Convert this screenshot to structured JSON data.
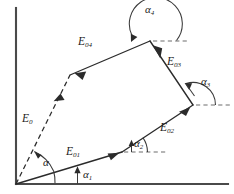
{
  "figure": {
    "background_color": "#ffffff",
    "line_color": "#2b2b2b",
    "axis_color": "#4a4a4a",
    "reference_line_color": "#6d6d6d"
  },
  "axes": {
    "origin": {
      "x": 16,
      "y": 184
    },
    "vertical_axis": {
      "x": 16,
      "y_top": 8,
      "y_bottom": 184
    },
    "horizontal_axis": {
      "y": 184,
      "x_left": 16,
      "x_right": 228
    }
  },
  "vectors": [
    {
      "id": "E01",
      "symbol": "E",
      "subscript": "01",
      "label": "E01",
      "from": {
        "x": 16,
        "y": 184
      },
      "to": {
        "x": 122,
        "y": 152
      },
      "style": "solid",
      "label_pos": {
        "x": 66,
        "y": 147
      }
    },
    {
      "id": "E02",
      "symbol": "E",
      "subscript": "02",
      "label": "E02",
      "from": {
        "x": 122,
        "y": 152
      },
      "to": {
        "x": 193,
        "y": 105
      },
      "style": "solid",
      "label_pos": {
        "x": 160,
        "y": 123
      }
    },
    {
      "id": "E03",
      "symbol": "E",
      "subscript": "03",
      "label": "E03",
      "from": {
        "x": 193,
        "y": 105
      },
      "to": {
        "x": 150,
        "y": 41
      },
      "style": "solid",
      "label_pos": {
        "x": 168,
        "y": 58
      }
    },
    {
      "id": "E04",
      "symbol": "E",
      "subscript": "04",
      "label": "E04",
      "from": {
        "x": 150,
        "y": 41
      },
      "to": {
        "x": 70,
        "y": 75
      },
      "style": "solid",
      "label_pos": {
        "x": 78,
        "y": 42
      }
    },
    {
      "id": "E0",
      "symbol": "E",
      "subscript": "0",
      "label": "E0",
      "from": {
        "x": 16,
        "y": 184
      },
      "to": {
        "x": 70,
        "y": 75
      },
      "style": "dashed",
      "label_pos": {
        "x": 22,
        "y": 114
      }
    }
  ],
  "angles": [
    {
      "id": "alpha",
      "symbol": "α",
      "subscript": "",
      "label": "α",
      "vertex": {
        "x": 16,
        "y": 184
      },
      "label_pos": {
        "x": 43,
        "y": 157
      },
      "has_reference_line": false,
      "description": "Angle between resultant E0 and component E01 at the origin"
    },
    {
      "id": "alpha1",
      "symbol": "α",
      "subscript": "1",
      "label": "α1",
      "vertex": {
        "x": 16,
        "y": 184
      },
      "label_pos": {
        "x": 83,
        "y": 170
      },
      "has_reference_line": false,
      "description": "Angle of E01 measured from the horizontal axis"
    },
    {
      "id": "alpha2",
      "symbol": "α",
      "subscript": "2",
      "label": "α2",
      "vertex": {
        "x": 122,
        "y": 152
      },
      "label_pos": {
        "x": 133,
        "y": 139
      },
      "has_reference_line": true,
      "reference_line": {
        "x1": 124,
        "y1": 152,
        "x2": 168,
        "y2": 152
      },
      "description": "Angle of E02 from horizontal reference at the E01-E02 junction"
    },
    {
      "id": "alpha3",
      "symbol": "α",
      "subscript": "3",
      "label": "α3",
      "vertex": {
        "x": 193,
        "y": 105
      },
      "label_pos": {
        "x": 200,
        "y": 76
      },
      "has_reference_line": true,
      "reference_line": {
        "x1": 195,
        "y1": 105,
        "x2": 231,
        "y2": 105
      },
      "description": "Angle of E03 from horizontal reference at the E02-E03 junction"
    },
    {
      "id": "alpha4",
      "symbol": "α",
      "subscript": "4",
      "label": "α4",
      "vertex": {
        "x": 150,
        "y": 41
      },
      "label_pos": {
        "x": 145,
        "y": 4
      },
      "has_reference_line": true,
      "reference_line": {
        "x1": 153,
        "y1": 41,
        "x2": 190,
        "y2": 41
      },
      "description": "Angle of E04 from horizontal reference at the apex E03-E04 junction"
    }
  ]
}
